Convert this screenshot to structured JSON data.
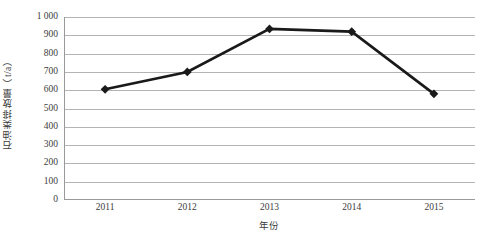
{
  "chart_data": {
    "type": "line",
    "title": "",
    "xlabel": "年份",
    "ylabel": "石油类排放量（t/a）",
    "categories": [
      "2011",
      "2012",
      "2013",
      "2014",
      "2015"
    ],
    "values": [
      605,
      700,
      935,
      920,
      580
    ],
    "series": [
      {
        "name": "石油类排放量",
        "values": [
          605,
          700,
          935,
          920,
          580
        ],
        "marker": "diamond",
        "line_color": "#1a1a1a",
        "marker_color": "#1a1a1a"
      }
    ],
    "ylim": [
      0,
      1000
    ],
    "ytick_step": 100,
    "ytick_labels": [
      "0",
      "100",
      "200",
      "300",
      "400",
      "500",
      "600",
      "700",
      "800",
      "900",
      "1 000"
    ],
    "ytick_values": [
      0,
      100,
      200,
      300,
      400,
      500,
      600,
      700,
      800,
      900,
      1000
    ],
    "grid": true,
    "grid_axis": "y",
    "grid_color": "#b4b4b4",
    "legend": false,
    "legend_position": "none",
    "axis_color": "#9a9a9a",
    "background_color": "#ffffff"
  }
}
